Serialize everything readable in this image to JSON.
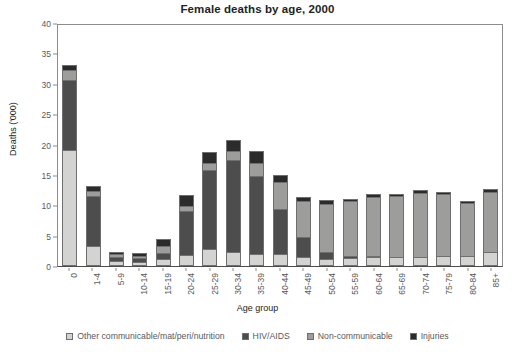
{
  "chart_data": {
    "type": "bar",
    "title": "Female deaths by age, 2000",
    "xlabel": "Age group",
    "ylabel": "Deaths ('000)",
    "ylim": [
      0,
      40
    ],
    "yticks": [
      0,
      5,
      10,
      15,
      20,
      25,
      30,
      35,
      40
    ],
    "grid": false,
    "stacked": true,
    "legend_position": "bottom",
    "categories": [
      "0",
      "1-4",
      "5-9",
      "10-14",
      "15-19",
      "20-24",
      "25-29",
      "30-34",
      "35-39",
      "40-44",
      "45-49",
      "50-54",
      "55-59",
      "60-64",
      "65-69",
      "70-74",
      "75-79",
      "80-84",
      "85+"
    ],
    "series": [
      {
        "name": "Other communicable/mat/peri/nutrition",
        "color": "#d3d3d1",
        "values": [
          18.8,
          3.0,
          0.5,
          0.4,
          0.8,
          1.5,
          2.4,
          2.0,
          1.7,
          1.7,
          1.2,
          0.8,
          1.0,
          1.1,
          1.2,
          1.2,
          1.3,
          1.3,
          2.0
        ]
      },
      {
        "name": "HIV/AIDS",
        "color": "#4d4d4d",
        "values": [
          11.4,
          8.0,
          0.5,
          0.4,
          0.9,
          7.0,
          12.9,
          15.0,
          12.7,
          7.2,
          3.1,
          1.0,
          0.2,
          0.1,
          0.0,
          0.0,
          0.0,
          0.0,
          0.0
        ]
      },
      {
        "name": "Non-communicable",
        "color": "#9d9d9b",
        "values": [
          1.4,
          0.7,
          0.3,
          0.2,
          0.9,
          0.7,
          1.0,
          1.2,
          1.9,
          4.3,
          5.8,
          7.8,
          8.8,
          9.5,
          9.8,
          10.3,
          10.0,
          8.5,
          9.7
        ]
      },
      {
        "name": "Injuries",
        "color": "#2b2b2b",
        "values": [
          0.7,
          0.6,
          0.2,
          0.3,
          1.0,
          1.6,
          1.7,
          1.8,
          1.8,
          0.9,
          0.5,
          0.4,
          0.2,
          0.3,
          0.2,
          0.3,
          0.3,
          0.2,
          0.3
        ]
      }
    ],
    "totals": [
      32.3,
      12.3,
      1.5,
      1.3,
      3.6,
      10.8,
      18.0,
      20.0,
      18.1,
      14.1,
      10.6,
      10.0,
      10.2,
      11.0,
      11.2,
      11.8,
      11.6,
      10.0,
      12.0
    ]
  }
}
